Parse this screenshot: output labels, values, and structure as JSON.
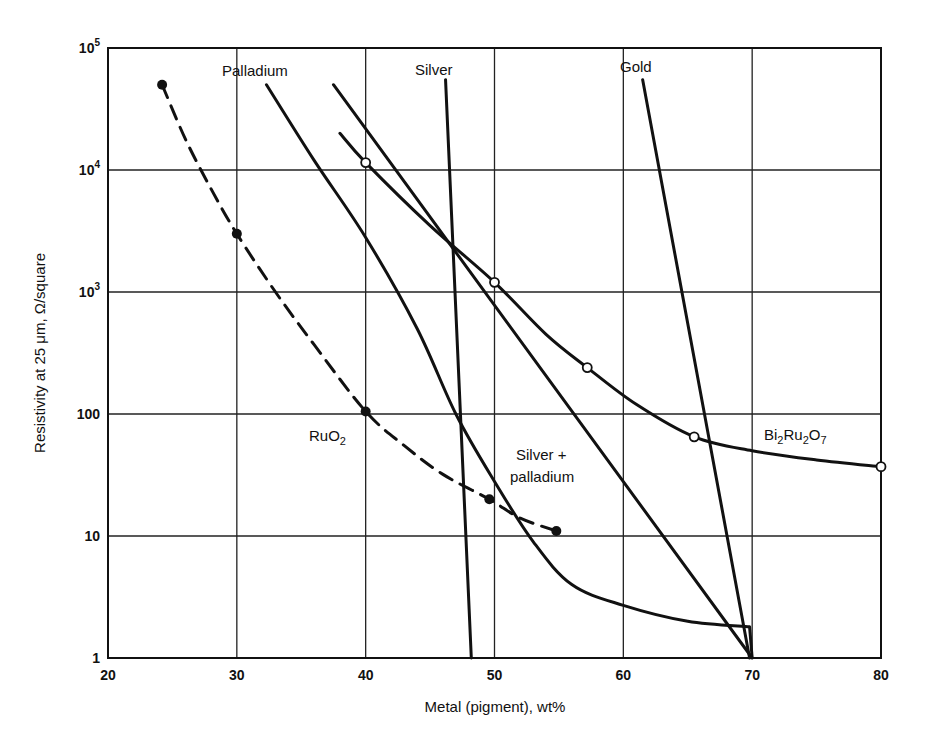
{
  "chart_data": {
    "type": "line",
    "title": "",
    "xlabel": "Metal (pigment), wt%",
    "ylabel": "Resistivity at 25 μm, Ω/square",
    "xlim": [
      20,
      80
    ],
    "ylim": [
      1,
      100000
    ],
    "yscale": "log",
    "grid": true,
    "legend": "none (inline curve labels)",
    "x_ticks": [
      "20",
      "30",
      "40",
      "50",
      "60",
      "70",
      "80"
    ],
    "y_ticks": [
      {
        "base": "10",
        "exp": "5",
        "value": 100000
      },
      {
        "base": "10",
        "exp": "4",
        "value": 10000
      },
      {
        "base": "10",
        "exp": "3",
        "value": 1000
      },
      {
        "base": "100",
        "exp": "",
        "value": 100
      },
      {
        "base": "10",
        "exp": "",
        "value": 10
      },
      {
        "base": "1",
        "exp": "",
        "value": 1
      }
    ],
    "series": [
      {
        "name": "RuO2",
        "label_main": "RuO",
        "label_sub": "2",
        "style": "dashed",
        "marker": "filled-circle",
        "points": [
          [
            24.2,
            50000
          ],
          [
            30,
            3000
          ],
          [
            40,
            105
          ],
          [
            49.6,
            20
          ],
          [
            54.8,
            11
          ]
        ],
        "curve": [
          [
            24.2,
            50000
          ],
          [
            26,
            18000
          ],
          [
            28,
            7000
          ],
          [
            30,
            3000
          ],
          [
            33,
            1000
          ],
          [
            36,
            370
          ],
          [
            40,
            105
          ],
          [
            43,
            55
          ],
          [
            46,
            32
          ],
          [
            49.6,
            20
          ],
          [
            52,
            14
          ],
          [
            54.8,
            11
          ]
        ]
      },
      {
        "name": "Bi2Ru2O7",
        "label_main": [
          "Bi",
          "Ru",
          "O"
        ],
        "label_sub": [
          "2",
          "2",
          "7"
        ],
        "style": "solid",
        "marker": "open-circle",
        "points": [
          [
            40,
            11500
          ],
          [
            50,
            1200
          ],
          [
            57.2,
            240
          ],
          [
            65.5,
            65
          ],
          [
            80,
            37
          ]
        ],
        "curve": [
          [
            38,
            20000
          ],
          [
            40,
            11500
          ],
          [
            45,
            3500
          ],
          [
            50,
            1200
          ],
          [
            54,
            450
          ],
          [
            57.2,
            240
          ],
          [
            61,
            120
          ],
          [
            65.5,
            65
          ],
          [
            70,
            50
          ],
          [
            75,
            42
          ],
          [
            80,
            37
          ]
        ]
      },
      {
        "name": "Palladium",
        "label": "Palladium",
        "style": "solid",
        "marker": "none",
        "curve": [
          [
            32.3,
            50000
          ],
          [
            36,
            12000
          ],
          [
            40,
            2800
          ],
          [
            44,
            500
          ],
          [
            47,
            100
          ],
          [
            50,
            28
          ],
          [
            53,
            9
          ],
          [
            56,
            4
          ],
          [
            60,
            2.7
          ],
          [
            65,
            2.0
          ],
          [
            69.8,
            1.8
          ],
          [
            70,
            1
          ]
        ]
      },
      {
        "name": "Silver + palladium",
        "label_line1": "Silver +",
        "label_line2": "palladium",
        "style": "solid",
        "marker": "none",
        "curve": [
          [
            37.5,
            50000
          ],
          [
            70,
            1
          ]
        ]
      },
      {
        "name": "Silver",
        "label": "Silver",
        "style": "solid",
        "marker": "none",
        "curve": [
          [
            46.2,
            55000
          ],
          [
            48.2,
            1
          ]
        ]
      },
      {
        "name": "Gold",
        "label": "Gold",
        "style": "solid",
        "marker": "none",
        "curve": [
          [
            61.5,
            55000
          ],
          [
            69.8,
            1
          ]
        ]
      }
    ],
    "annotations": [
      {
        "text": "Palladium",
        "x": 32.5,
        "y": 70000
      },
      {
        "text": "Silver",
        "x": 46,
        "y": 70000
      },
      {
        "text": "Gold",
        "x": 62,
        "y": 70000
      },
      {
        "text": "RuO2",
        "x": 38,
        "y": 75
      },
      {
        "text": "Silver + palladium",
        "x": 52,
        "y": 20
      },
      {
        "text": "Bi2Ru2O7",
        "x": 75,
        "y": 60
      }
    ]
  }
}
